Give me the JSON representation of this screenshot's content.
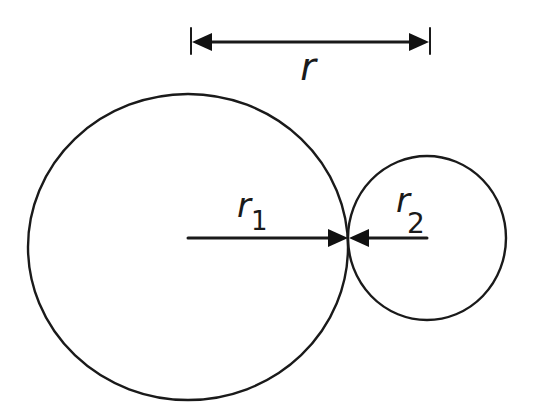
{
  "diagram": {
    "type": "two tangent circles with radius dimensions",
    "labels": {
      "distance": "r",
      "radius1_main": "r",
      "radius1_sub": "1",
      "radius2_main": "r",
      "radius2_sub": "2"
    },
    "circles": [
      {
        "name": "large-circle",
        "cx": 188,
        "cy": 247,
        "rx": 160,
        "ry": 153
      },
      {
        "name": "small-circle",
        "cx": 427,
        "cy": 238,
        "rx": 79,
        "ry": 82
      }
    ],
    "dimension_line": {
      "x1": 191,
      "x2": 430,
      "y": 42,
      "tick_top": 28,
      "tick_bottom": 54
    },
    "radius_arrows": {
      "r1": {
        "from_x": 188,
        "to_x": 348,
        "y": 238
      },
      "r2": {
        "from_x": 427,
        "to_x": 348,
        "y": 238
      }
    },
    "colors": {
      "line": "#1a1a1a",
      "background": "#ffffff"
    }
  }
}
